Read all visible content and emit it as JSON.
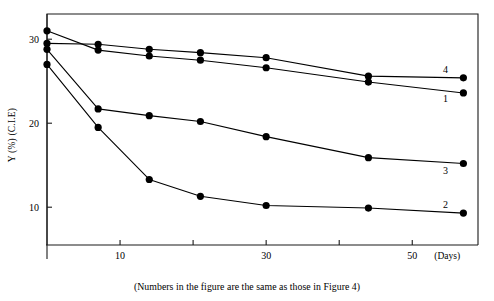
{
  "chart_data": {
    "type": "line",
    "title": "",
    "subtitle": "",
    "xlabel": "(Days)",
    "ylabel": "Y (%) (C.I.E)",
    "xlim": [
      0,
      59
    ],
    "ylim": [
      5.5,
      33
    ],
    "grid": false,
    "legend_position": "right-inline",
    "x_ticks": [
      10,
      20,
      30,
      40,
      50
    ],
    "x_tick_labels": [
      "10",
      "",
      "30",
      "",
      "50"
    ],
    "y_ticks": [
      10,
      20,
      30
    ],
    "y_tick_labels": [
      "10",
      "20",
      "30"
    ],
    "annotation": "(Numbers in the figure are the same as those in Figure 4)",
    "series": [
      {
        "name": "4",
        "label": "4",
        "x": [
          0,
          7,
          14,
          21,
          30,
          44,
          57
        ],
        "values": [
          29.5,
          29.4,
          28.8,
          28.4,
          27.8,
          25.6,
          25.4
        ]
      },
      {
        "name": "1",
        "label": "1",
        "x": [
          0,
          7,
          14,
          21,
          30,
          44,
          57
        ],
        "values": [
          31.0,
          28.7,
          28.0,
          27.5,
          26.6,
          24.9,
          23.6
        ]
      },
      {
        "name": "3",
        "label": "3",
        "x": [
          0,
          7,
          14,
          21,
          30,
          44,
          57
        ],
        "values": [
          28.8,
          21.7,
          20.9,
          20.2,
          18.4,
          15.9,
          15.2
        ]
      },
      {
        "name": "2",
        "label": "2",
        "x": [
          0,
          7,
          14,
          21,
          30,
          44,
          57
        ],
        "values": [
          27.0,
          19.5,
          13.3,
          11.3,
          10.2,
          9.9,
          9.3
        ]
      }
    ]
  }
}
